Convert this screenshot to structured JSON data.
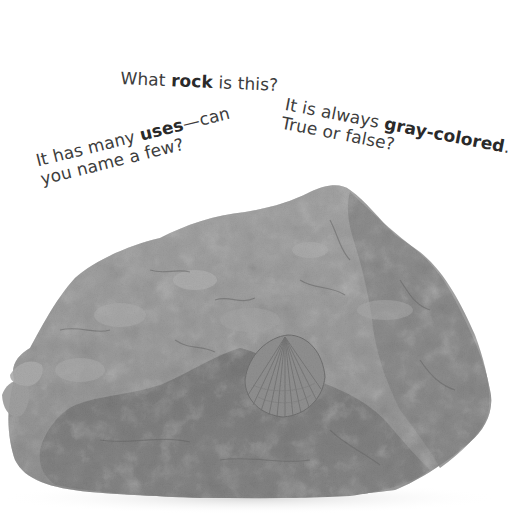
{
  "captions": {
    "q1": {
      "pre": "What ",
      "bold": "rock",
      "post": " is this?"
    },
    "q2": {
      "line1_pre": "It is always ",
      "line1_bold": "gray-colored",
      "line1_post": ".",
      "line2": "True or false?"
    },
    "q3": {
      "line1_pre": "It has many ",
      "line1_bold": "uses",
      "line1_post": "—can",
      "line2": "you name a few?"
    }
  },
  "image": {
    "subject": "gray fossiliferous rock with a ribbed shell fossil",
    "colors": {
      "light": "#b9b9b9",
      "mid": "#8c8c8c",
      "dark": "#5e5e5e",
      "shadow": "#e6e6e6"
    }
  }
}
